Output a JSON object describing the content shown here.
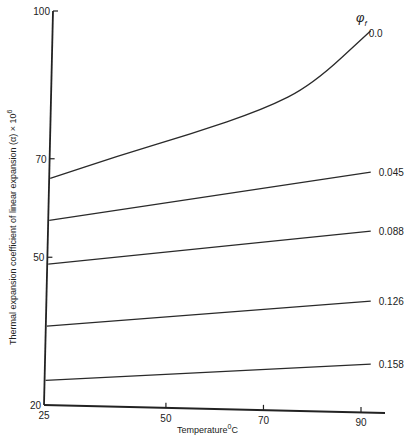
{
  "chart_data": {
    "type": "line",
    "title": "",
    "xlabel": "Temperature °C",
    "ylabel": "Thermal expansion coefficient of linear expansion (α) × 10^6",
    "xlim": [
      25,
      93
    ],
    "ylim": [
      20,
      100
    ],
    "x_ticks": [
      25,
      50,
      70,
      90
    ],
    "y_ticks": [
      20,
      50,
      70,
      100
    ],
    "grid": false,
    "legend_title": "φf",
    "legend_position": "right, inline labels at line ends",
    "series": [
      {
        "name": "0.0",
        "x": [
          25,
          40,
          55,
          70,
          80,
          92
        ],
        "values": [
          66,
          70.5,
          75,
          80,
          85,
          96
        ]
      },
      {
        "name": "0.045",
        "x": [
          25,
          92
        ],
        "values": [
          57.5,
          67.3
        ]
      },
      {
        "name": "0.088",
        "x": [
          25,
          92
        ],
        "values": [
          48.6,
          55.3
        ]
      },
      {
        "name": "0.126",
        "x": [
          25,
          92
        ],
        "values": [
          36,
          41.1
        ]
      },
      {
        "name": "0.158",
        "x": [
          25,
          92
        ],
        "values": [
          25,
          28.3
        ]
      }
    ]
  },
  "labels": {
    "y_axis_title": "Thermal expansion coefficient of linear expansion (α) × 10",
    "y_axis_exp": "6",
    "x_axis_title": "Temperature",
    "x_axis_unit_sup": "0",
    "x_axis_unit": "C",
    "legend_symbol": "φ",
    "legend_sub": "f"
  }
}
